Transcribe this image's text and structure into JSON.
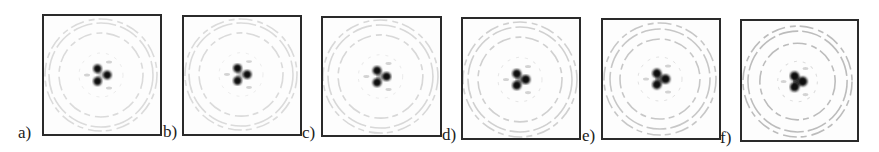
{
  "figure": {
    "panels": [
      {
        "label": "a)",
        "box": [
          42,
          14,
          120,
          122
        ],
        "label_pos": [
          18,
          124
        ],
        "center": [
          57,
          59
        ],
        "rings": [
          22,
          42,
          52,
          56
        ],
        "ring_opacity": 0.35,
        "spot_sep": 7,
        "spot_r": 4.2,
        "fill": 0.25
      },
      {
        "label": "b)",
        "box": [
          182,
          15,
          120,
          121
        ],
        "label_pos": [
          163,
          123
        ],
        "center": [
          57,
          58
        ],
        "rings": [
          22,
          42,
          52,
          56
        ],
        "ring_opacity": 0.35,
        "spot_sep": 7,
        "spot_r": 4.2,
        "fill": 0.3
      },
      {
        "label": "c)",
        "box": [
          321,
          16,
          121,
          121
        ],
        "label_pos": [
          302,
          124
        ],
        "center": [
          57,
          59
        ],
        "rings": [
          22,
          42,
          52,
          57
        ],
        "ring_opacity": 0.38,
        "spot_sep": 6.8,
        "spot_r": 4.3,
        "fill": 0.4
      },
      {
        "label": "d)",
        "box": [
          461,
          17,
          120,
          123
        ],
        "label_pos": [
          442,
          126
        ],
        "center": [
          57,
          60
        ],
        "rings": [
          22,
          42,
          52,
          57
        ],
        "ring_opacity": 0.45,
        "spot_sep": 6.5,
        "spot_r": 4.4,
        "fill": 0.55
      },
      {
        "label": "e)",
        "box": [
          601,
          18,
          120,
          122
        ],
        "label_pos": [
          582,
          127
        ],
        "center": [
          57,
          59
        ],
        "rings": [
          22,
          40,
          50,
          56
        ],
        "ring_opacity": 0.55,
        "spot_sep": 6.3,
        "spot_r": 4.5,
        "fill": 0.7
      },
      {
        "label": "f)",
        "box": [
          740,
          19,
          119,
          123
        ],
        "label_pos": [
          720,
          129
        ],
        "center": [
          56,
          60
        ],
        "rings": [
          20,
          38,
          50,
          55
        ],
        "ring_opacity": 0.65,
        "spot_sep": 6,
        "spot_r": 4.6,
        "fill": 0.9
      }
    ],
    "colors": {
      "frame": "#2a2a2a",
      "ring": "#9a9a9a",
      "spot": "#111111",
      "background": "#fdfdfd"
    }
  }
}
